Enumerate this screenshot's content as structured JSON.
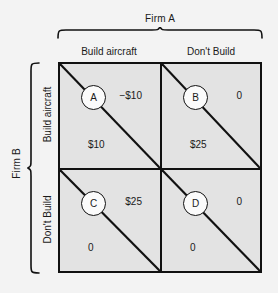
{
  "diagram": {
    "column_group_label": "Firm A",
    "row_group_label": "Firm B",
    "column_headers": [
      "Build aircraft",
      "Don't Build"
    ],
    "row_headers": [
      "Build aircraft",
      "Don't Build"
    ],
    "colors": {
      "background": "#f3f3f3",
      "cell_fill": "#e3e3e3",
      "line": "#111111",
      "circle_fill": "#fbfbfb",
      "text": "#1a1a1a"
    },
    "cells": [
      {
        "id": "A",
        "node_label": "A",
        "row": "Build aircraft",
        "column": "Build aircraft",
        "upper_right_payoff": "−$10",
        "lower_left_payoff": "$10"
      },
      {
        "id": "B",
        "node_label": "B",
        "row": "Build aircraft",
        "column": "Don't Build",
        "upper_right_payoff": "0",
        "lower_left_payoff": "$25"
      },
      {
        "id": "C",
        "node_label": "C",
        "row": "Don't Build",
        "column": "Build aircraft",
        "upper_right_payoff": "$25",
        "lower_left_payoff": "0"
      },
      {
        "id": "D",
        "node_label": "D",
        "row": "Don't Build",
        "column": "Don't Build",
        "upper_right_payoff": "0",
        "lower_left_payoff": "0"
      }
    ]
  }
}
